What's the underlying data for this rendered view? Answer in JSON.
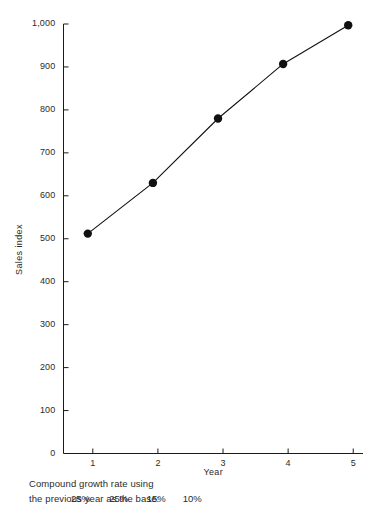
{
  "chart_data": {
    "type": "line",
    "title": "",
    "subtitle": "",
    "xlabel": "Year",
    "ylabel": "Sales index",
    "x": [
      1,
      2,
      3,
      4,
      5
    ],
    "values": [
      512,
      630,
      780,
      907,
      997
    ],
    "series": [
      {
        "name": "Sales index",
        "values": [
          512,
          630,
          780,
          907,
          997
        ]
      }
    ],
    "xtick_labels": [
      "1",
      "2",
      "3",
      "4",
      "5"
    ],
    "ytick_labels": [
      "0",
      "100",
      "200",
      "300",
      "400",
      "500",
      "600",
      "700",
      "800",
      "900",
      "1,000"
    ],
    "ytick_values": [
      0,
      100,
      200,
      300,
      400,
      500,
      600,
      700,
      800,
      900,
      1000
    ],
    "xlim": [
      0.55,
      5.15
    ],
    "ylim": [
      0,
      1000
    ],
    "grid": false,
    "legend": false,
    "legend_position": "none",
    "marker": "filled-circle",
    "line_color": "#111111",
    "marker_color": "#111111",
    "background_color": "#ffffff",
    "annotations": {
      "note_line_1": "Compound growth rate using",
      "note_line_2": "the previous year as the base:",
      "growth_rates": [
        "25%",
        "25%",
        "15%",
        "10%"
      ],
      "growth_rate_intervals": [
        "1 to 2",
        "2 to 3",
        "3 to 4",
        "4 to 5"
      ]
    }
  }
}
